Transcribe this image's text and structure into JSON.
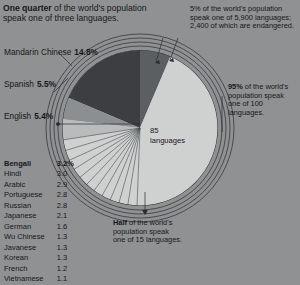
{
  "notes": {
    "quarter": {
      "lead": "One quarter",
      "rest": " of the world's population speak one of three languages."
    },
    "five_percent": "5% of the world's population speak one of 5,900 languages; 2,400 of which are endangered.",
    "ninety_five_lead": "95%",
    "ninety_five_rest": " of the world's population speak one of 100 languages.",
    "half_lead": "Half",
    "half_rest": " of the world's population speak one of 15 languages."
  },
  "center": {
    "count": "85",
    "unit": "languages"
  },
  "top_languages": [
    {
      "name": "Mandarin Chinese",
      "value": "14.8%"
    },
    {
      "name": "Spanish",
      "value": "5.5%"
    },
    {
      "name": "English",
      "value": "5.4%"
    }
  ],
  "chart_data": {
    "type": "pie",
    "unit": "percent of world population",
    "categories": [
      "Mandarin Chinese",
      "Spanish",
      "English",
      "Bengali",
      "Hindi",
      "Arabic",
      "Portuguese",
      "Russian",
      "Japanese",
      "German",
      "Wu Chinese",
      "Javanese",
      "Korean",
      "French",
      "Vietnamese",
      "Other (remaining 85 languages)"
    ],
    "values": [
      14.8,
      5.5,
      5.4,
      3.2,
      3.0,
      2.9,
      2.8,
      2.8,
      2.1,
      1.6,
      1.3,
      1.3,
      1.3,
      1.2,
      1.1,
      48.7
    ],
    "annotations": [
      "One quarter of the world's population speak one of three languages.",
      "Half of the world's population speak one of 15 languages.",
      "95% of the world's population speak one of 100 languages.",
      "5% of the world's population speak one of 5,900 languages; 2,400 of which are endangered."
    ],
    "center_label": "85 languages",
    "legend": "labels placed at left of chart",
    "grid": false
  },
  "table": {
    "rows": [
      {
        "name": "Bengali",
        "value": "3.2%"
      },
      {
        "name": "Hindi",
        "value": "3.0"
      },
      {
        "name": "Arabic",
        "value": "2.9"
      },
      {
        "name": "Portuguese",
        "value": "2.8"
      },
      {
        "name": "Russian",
        "value": "2.8"
      },
      {
        "name": "Japanese",
        "value": "2.1"
      },
      {
        "name": "German",
        "value": "1.6"
      },
      {
        "name": "Wu Chinese",
        "value": "1.3"
      },
      {
        "name": "Javanese",
        "value": "1.3"
      },
      {
        "name": "Korean",
        "value": "1.3"
      },
      {
        "name": "French",
        "value": "1.2"
      },
      {
        "name": "Vietnamese",
        "value": "1.1"
      }
    ]
  },
  "colors": {
    "background": "#8f9193",
    "dark_slice": "#3c3e41",
    "mid_slice": "#63666a",
    "light_slice": "#b9bbbc",
    "pale_slice": "#cfd1d1",
    "line": "#2b2d30"
  }
}
